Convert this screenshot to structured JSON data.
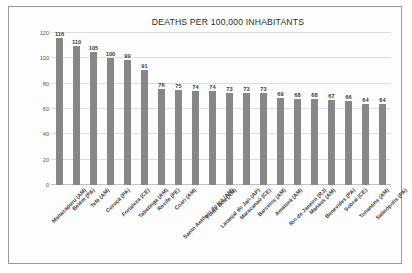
{
  "chart_data": {
    "type": "bar",
    "title": "DEATHS PER 100,000 INHABITANTS",
    "xlabel": "",
    "ylabel": "",
    "ylim": [
      0,
      120
    ],
    "yticks": [
      120,
      100,
      80,
      60,
      40,
      20,
      0
    ],
    "grid": true,
    "legend": false,
    "bar_color": "#878787",
    "categories": [
      "Manacapuru (AM)",
      "Belém (PA)",
      "Tefé (AM)",
      "Curuçá (PA)",
      "Fortaleza (CE)",
      "Tabatinga (AM)",
      "Recife (PE)",
      "Coari (AM)",
      "Santo Antônio do Içá (AM)",
      "Fonte Boa (AM)",
      "Laranjal do Jari (AP)",
      "Maracanaú (CE)",
      "Barcelos (AM)",
      "Amaturá (AM)",
      "Rio de Janeiro (RJ)",
      "Manaus (AM)",
      "Benevides (PA)",
      "Sobral (CE)",
      "Tonantins (AM)",
      "Salinópolis (PA)"
    ],
    "values": [
      116,
      110,
      105,
      100,
      99,
      91,
      76,
      75,
      74,
      74,
      73,
      73,
      73,
      69,
      68,
      68,
      67,
      66,
      64,
      64
    ]
  }
}
